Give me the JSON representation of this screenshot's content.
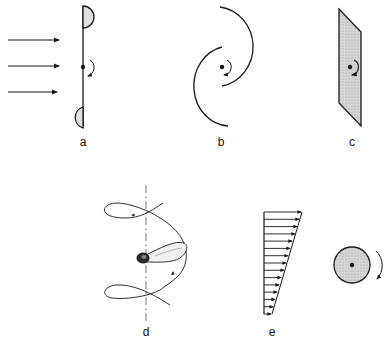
{
  "panels": {
    "a": {
      "label": "a",
      "description": "flat plate with two half-cups, flow arrows from left, rotation about center pivot"
    },
    "b": {
      "label": "b",
      "description": "two offset semicircular vanes (Savonius-type) rotating about center"
    },
    "c": {
      "label": "c",
      "description": "inclined flat plate (shaded) rotating about center"
    },
    "d": {
      "label": "d",
      "description": "winged seed (samara) autorotating with helical trajectory about vertical axis"
    },
    "e": {
      "label": "e",
      "description": "linear shear velocity profile and rotating shaded cylinder"
    }
  },
  "colors": {
    "stroke": "#1a1a1a",
    "fill_shaded": "#c8c8c8",
    "background": "#ffffff"
  },
  "shear_profile": {
    "arrow_count": 15
  }
}
